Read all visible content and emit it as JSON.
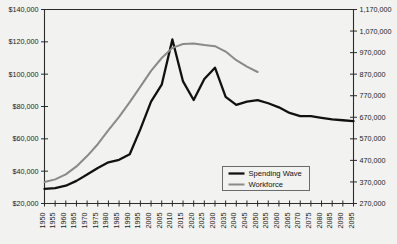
{
  "chart_data": {
    "type": "line",
    "title": "",
    "xlabel": "",
    "ylabel": "",
    "grid": false,
    "legend_position": "bottom-right",
    "x": [
      1950,
      1955,
      1960,
      1965,
      1970,
      1975,
      1980,
      1985,
      1990,
      1995,
      2000,
      2005,
      2010,
      2015,
      2020,
      2025,
      2030,
      2035,
      2040,
      2045,
      2050,
      2055,
      2060,
      2065,
      2070,
      2075,
      2080,
      2085,
      2090,
      2095
    ],
    "xtick_labels": [
      "1950",
      "1955",
      "1960",
      "1965",
      "1970",
      "1975",
      "1980",
      "1985",
      "1990",
      "1995",
      "2000",
      "2005",
      "2010",
      "2015",
      "2020",
      "2025",
      "2030",
      "2035",
      "2040",
      "2045",
      "2050",
      "2055",
      "2060",
      "2065",
      "2070",
      "2075",
      "2080",
      "2085",
      "2090",
      "2095"
    ],
    "left_axis": {
      "label": "",
      "ylim": [
        20000,
        140000
      ],
      "tick_values": [
        20000,
        40000,
        60000,
        80000,
        100000,
        120000,
        140000
      ],
      "tick_labels": [
        "$20,000",
        "$40,000",
        "$60,000",
        "$80,000",
        "$100,000",
        "$120,000",
        "$140,000"
      ]
    },
    "right_axis": {
      "label": "",
      "ylim": [
        270000,
        1170000
      ],
      "tick_values": [
        270000,
        370000,
        470000,
        570000,
        670000,
        770000,
        870000,
        970000,
        1070000,
        1170000
      ],
      "tick_labels": [
        "270,000",
        "370,000",
        "470,000",
        "570,000",
        "670,000",
        "770,000",
        "870,000",
        "970,000",
        "1,070,000",
        "1,170,000"
      ]
    },
    "series": [
      {
        "name": "Spending Wave",
        "axis": "left",
        "color": "#111111",
        "width": 2.3,
        "values": [
          29000,
          29500,
          31000,
          34000,
          38000,
          42000,
          45500,
          47000,
          50500,
          66000,
          83000,
          93500,
          121500,
          95500,
          84000,
          97000,
          104000,
          86000,
          81000,
          83000,
          84000,
          82000,
          79500,
          76000,
          74000,
          74000,
          73000,
          72000,
          71500,
          71000
        ]
      },
      {
        "name": "Workforce",
        "axis": "right",
        "color": "#8a8a8a",
        "width": 2.0,
        "values": [
          370000,
          382000,
          405000,
          442000,
          490000,
          545000,
          610000,
          672000,
          740000,
          812000,
          885000,
          945000,
          992000,
          1010000,
          1012000,
          1005000,
          1000000,
          975000,
          935000,
          905000,
          880000,
          null,
          null,
          null,
          null,
          null,
          null,
          null,
          null,
          null
        ]
      }
    ],
    "legend": [
      {
        "label": "Spending Wave",
        "color": "#111111"
      },
      {
        "label": "Workforce",
        "color": "#8a8a8a"
      }
    ]
  }
}
